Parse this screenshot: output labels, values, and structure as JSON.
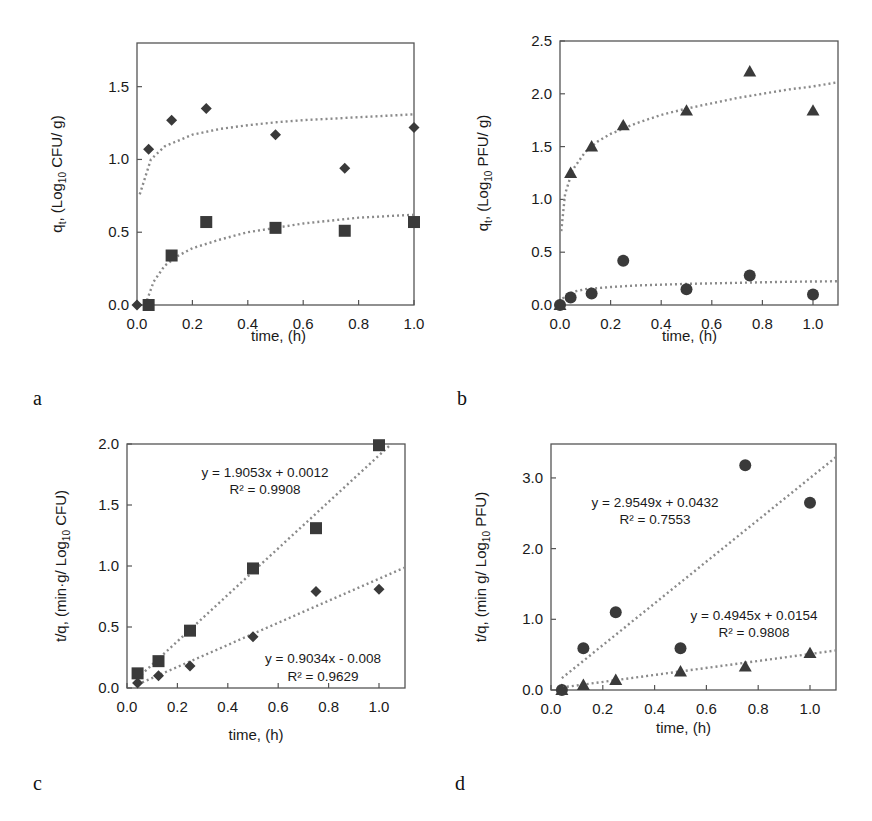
{
  "figure": {
    "panels": [
      "a",
      "b",
      "c",
      "d"
    ],
    "marker_color": "#3a3a3a",
    "fit_line_color": "#8a8a8a"
  },
  "chart_data": [
    {
      "panel": "a",
      "type": "scatter",
      "title": "",
      "xlabel": "time, (h)",
      "ylabel": "q_t, (Log10 CFU/ g)",
      "ylabel_parts": {
        "pre": "q",
        "pre_sub": "t",
        "mid": ", (Log",
        "sub": "10",
        "post": " CFU/ g)"
      },
      "xlim": [
        0,
        1.0
      ],
      "ylim": [
        0,
        1.8
      ],
      "xticks": [
        "0.0",
        "0.2",
        "0.4",
        "0.6",
        "0.8",
        "1.0"
      ],
      "xtick_values": [
        0,
        0.2,
        0.4,
        0.6,
        0.8,
        1.0
      ],
      "yticks": [
        "0.0",
        "0.5",
        "1.0",
        "1.5"
      ],
      "ytick_values": [
        0,
        0.5,
        1.0,
        1.5
      ],
      "grid": false,
      "legend": null,
      "series": [
        {
          "name": "diamond series",
          "marker": "diamond",
          "x": [
            0,
            0.042,
            0.125,
            0.25,
            0.5,
            0.75,
            1.0
          ],
          "y": [
            0,
            1.07,
            1.27,
            1.35,
            1.17,
            0.94,
            1.22
          ],
          "fit": {
            "kind": "log",
            "x": [
              0.01,
              0.05,
              0.1,
              0.2,
              0.3,
              0.4,
              0.5,
              0.6,
              0.7,
              0.8,
              0.9,
              1.0
            ],
            "y": [
              0.76,
              1.0,
              1.09,
              1.17,
              1.21,
              1.235,
              1.255,
              1.27,
              1.28,
              1.29,
              1.3,
              1.31
            ]
          }
        },
        {
          "name": "square series",
          "marker": "square",
          "x": [
            0.042,
            0.125,
            0.25,
            0.5,
            0.75,
            1.0
          ],
          "y": [
            0,
            0.34,
            0.57,
            0.53,
            0.51,
            0.57
          ],
          "fit": {
            "kind": "log",
            "x": [
              0.03,
              0.06,
              0.1,
              0.15,
              0.2,
              0.3,
              0.4,
              0.5,
              0.6,
              0.7,
              0.8,
              0.9,
              1.0
            ],
            "y": [
              0.0,
              0.16,
              0.27,
              0.34,
              0.39,
              0.45,
              0.5,
              0.53,
              0.56,
              0.58,
              0.6,
              0.61,
              0.62
            ]
          }
        }
      ]
    },
    {
      "panel": "b",
      "type": "scatter",
      "title": "",
      "xlabel": "time, (h)",
      "ylabel": "q_t, (Log10 PFU/ g)",
      "ylabel_parts": {
        "pre": "q",
        "pre_sub": "t",
        "mid": ", (Log",
        "sub": "10",
        "post": " PFU/ g)"
      },
      "xlim": [
        0,
        1.1
      ],
      "ylim": [
        0,
        2.5
      ],
      "xticks": [
        "0.0",
        "0.2",
        "0.4",
        "0.6",
        "0.8",
        "1.0"
      ],
      "xtick_values": [
        0,
        0.2,
        0.4,
        0.6,
        0.8,
        1.0
      ],
      "yticks": [
        "0.0",
        "0.5",
        "1.0",
        "1.5",
        "2.0",
        "2.5"
      ],
      "ytick_values": [
        0,
        0.5,
        1.0,
        1.5,
        2.0,
        2.5
      ],
      "grid": false,
      "legend": null,
      "series": [
        {
          "name": "triangle series",
          "marker": "triangle",
          "x": [
            0,
            0.042,
            0.125,
            0.25,
            0.5,
            0.75,
            1.0
          ],
          "y": [
            0,
            1.25,
            1.5,
            1.7,
            1.84,
            2.21,
            1.84
          ],
          "fit": {
            "kind": "log",
            "x": [
              0.005,
              0.02,
              0.05,
              0.1,
              0.15,
              0.2,
              0.3,
              0.4,
              0.5,
              0.6,
              0.7,
              0.8,
              0.9,
              1.0,
              1.1
            ],
            "y": [
              0.7,
              1.05,
              1.28,
              1.45,
              1.55,
              1.62,
              1.72,
              1.8,
              1.86,
              1.91,
              1.96,
              2.0,
              2.04,
              2.07,
              2.11
            ]
          }
        },
        {
          "name": "circle series",
          "marker": "circle",
          "x": [
            0,
            0.042,
            0.125,
            0.25,
            0.5,
            0.75,
            1.0
          ],
          "y": [
            0,
            0.07,
            0.11,
            0.42,
            0.15,
            0.28,
            0.1
          ],
          "fit": {
            "kind": "log",
            "x": [
              0.01,
              0.03,
              0.06,
              0.1,
              0.2,
              0.3,
              0.5,
              0.7,
              0.9,
              1.1
            ],
            "y": [
              0.06,
              0.1,
              0.13,
              0.15,
              0.17,
              0.185,
              0.2,
              0.21,
              0.22,
              0.225
            ]
          }
        }
      ]
    },
    {
      "panel": "c",
      "type": "scatter",
      "title": "",
      "xlabel": "time, (h)",
      "ylabel": "t/q, (min·g/ Log10 CFU)",
      "ylabel_parts": {
        "pre": "t/q, (min·g/ Log",
        "sub": "10",
        "post": " CFU)"
      },
      "xlim": [
        0,
        1.1
      ],
      "ylim": [
        0,
        2.0
      ],
      "xticks": [
        "0.0",
        "0.2",
        "0.4",
        "0.6",
        "0.8",
        "1.0"
      ],
      "xtick_values": [
        0,
        0.2,
        0.4,
        0.6,
        0.8,
        1.0
      ],
      "yticks": [
        "0.0",
        "0.5",
        "1.0",
        "1.5",
        "2.0"
      ],
      "ytick_values": [
        0,
        0.5,
        1.0,
        1.5,
        2.0
      ],
      "grid": false,
      "legend": null,
      "series": [
        {
          "name": "square series",
          "marker": "square",
          "x": [
            0.042,
            0.125,
            0.25,
            0.5,
            0.75,
            1.0
          ],
          "y": [
            0.12,
            0.22,
            0.47,
            0.98,
            1.31,
            1.99
          ],
          "fit": {
            "kind": "linear",
            "slope": 1.9053,
            "intercept": 0.0012,
            "x_range": [
              0.042,
              1.05
            ]
          },
          "annotation": {
            "equation": "y = 1.9053x + 0.0012",
            "r2": "R² = 0.9908"
          }
        },
        {
          "name": "diamond series",
          "marker": "diamond",
          "x": [
            0.042,
            0.125,
            0.25,
            0.5,
            0.75,
            1.0
          ],
          "y": [
            0.04,
            0.1,
            0.18,
            0.42,
            0.79,
            0.81
          ],
          "fit": {
            "kind": "linear",
            "slope": 0.9034,
            "intercept": -0.008,
            "x_range": [
              0.042,
              1.1
            ]
          },
          "annotation": {
            "equation": "y = 0.9034x - 0.008",
            "r2": "R² = 0.9629"
          }
        }
      ]
    },
    {
      "panel": "d",
      "type": "scatter",
      "title": "",
      "xlabel": "time, (h)",
      "ylabel": "t/q, (min g/ Log10 PFU)",
      "ylabel_parts": {
        "pre": "t/q, (min g/ Log",
        "sub": "10",
        "post": " PFU)"
      },
      "xlim": [
        0,
        1.1
      ],
      "ylim": [
        0,
        3.48
      ],
      "xticks": [
        "0.0",
        "0.2",
        "0.4",
        "0.6",
        "0.8",
        "1.0"
      ],
      "xtick_values": [
        0,
        0.2,
        0.4,
        0.6,
        0.8,
        1.0
      ],
      "yticks": [
        "0.0",
        "1.0",
        "2.0",
        "3.0"
      ],
      "ytick_values": [
        0,
        1.0,
        2.0,
        3.0
      ],
      "grid": false,
      "legend": null,
      "series": [
        {
          "name": "circle series",
          "marker": "circle",
          "x": [
            0.042,
            0.125,
            0.25,
            0.5,
            0.75,
            1.0
          ],
          "y": [
            0,
            0.59,
            1.1,
            0.59,
            3.18,
            2.65
          ],
          "fit": {
            "kind": "linear",
            "slope": 2.9549,
            "intercept": 0.0432,
            "x_range": [
              0.042,
              1.1
            ]
          },
          "annotation": {
            "equation": "y = 2.9549x + 0.0432",
            "r2": "R² = 0.7553"
          }
        },
        {
          "name": "triangle series",
          "marker": "triangle",
          "x": [
            0.042,
            0.125,
            0.25,
            0.5,
            0.75,
            1.0
          ],
          "y": [
            0,
            0.07,
            0.14,
            0.26,
            0.33,
            0.52
          ],
          "fit": {
            "kind": "linear",
            "slope": 0.4945,
            "intercept": 0.0154,
            "x_range": [
              0.042,
              1.1
            ]
          },
          "annotation": {
            "equation": "y = 0.4945x + 0.0154",
            "r2": "R² = 0.9808"
          }
        }
      ]
    }
  ]
}
